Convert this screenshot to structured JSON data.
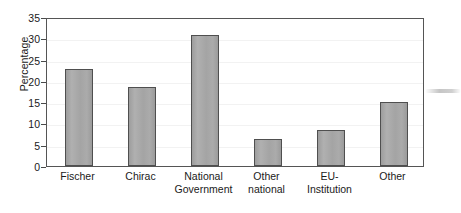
{
  "chart_data": {
    "type": "bar",
    "title": "",
    "xlabel": "",
    "ylabel": "Percentage",
    "categories": [
      "Fischer",
      "Chirac",
      "National\nGovernment",
      "Other\nnational",
      "EU-\nInstitution",
      "Other"
    ],
    "values": [
      22.7,
      18.5,
      30.8,
      6.3,
      8.5,
      15.0
    ],
    "ylim": [
      0,
      35
    ],
    "ytick_labels": [
      "0",
      "5",
      "10",
      "15",
      "20",
      "25",
      "30",
      "35"
    ],
    "ytick_values": [
      0,
      5,
      10,
      15,
      20,
      25,
      30,
      35
    ],
    "grid": false,
    "legend": "none",
    "bar_fill_color": "#a6a6a6",
    "bar_edge_color": "#4f4f4f",
    "frame_color": "#555555",
    "background_color": "#ffffff",
    "text_color": "#1a1a1a"
  }
}
